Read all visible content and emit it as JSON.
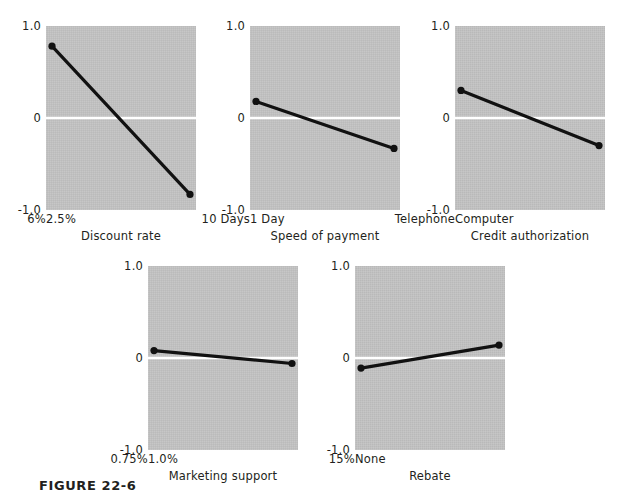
{
  "figure": {
    "caption": "FIGURE 22-6",
    "colors": {
      "plot_background": "#c2c2c2",
      "zero_line": "#ffffff",
      "series_line": "#111111",
      "text": "#231f20",
      "page_background": "#ffffff"
    }
  },
  "chart_data": {
    "type": "line",
    "title": "FIGURE 22-6",
    "ylabel": "",
    "xlabel": "",
    "ylim": [
      -1.0,
      1.0
    ],
    "yticks": [
      "1.0",
      "0",
      "-1.0"
    ],
    "ytick_values": [
      1.0,
      0,
      -1.0
    ],
    "grid": false,
    "legend": "none",
    "panel_layout": [
      3,
      2
    ],
    "panels": [
      {
        "index": 1,
        "xlabel": "Discount rate",
        "categories": [
          "2.5%",
          "6%"
        ],
        "values": [
          0.78,
          -0.83
        ],
        "ylim": [
          -1.0,
          1.0
        ],
        "yticks": [
          "1.0",
          "0",
          "-1.0"
        ]
      },
      {
        "index": 2,
        "xlabel": "Speed of payment",
        "categories": [
          "1 Day",
          "10 Days"
        ],
        "values": [
          0.18,
          -0.33
        ],
        "ylim": [
          -1.0,
          1.0
        ],
        "yticks": [
          "1.0",
          "0",
          "-1.0"
        ]
      },
      {
        "index": 3,
        "xlabel": "Credit authorization",
        "categories": [
          "Computer",
          "Telephone"
        ],
        "values": [
          0.3,
          -0.3
        ],
        "ylim": [
          -1.0,
          1.0
        ],
        "yticks": [
          "1.0",
          "0",
          "-1.0"
        ]
      },
      {
        "index": 4,
        "xlabel": "Marketing support",
        "categories": [
          "1.0%",
          "0.75%"
        ],
        "values": [
          0.08,
          -0.06
        ],
        "ylim": [
          -1.0,
          1.0
        ],
        "yticks": [
          "1.0",
          "0",
          "-1.0"
        ]
      },
      {
        "index": 5,
        "xlabel": "Rebate",
        "categories": [
          "None",
          "15%"
        ],
        "values": [
          -0.11,
          0.14
        ],
        "ylim": [
          -1.0,
          1.0
        ],
        "yticks": [
          "1.0",
          "0",
          "-1.0"
        ]
      }
    ]
  }
}
